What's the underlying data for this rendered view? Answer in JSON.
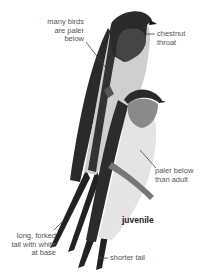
{
  "illustration": {
    "subject": "barn swallow adult and juvenile",
    "colors": {
      "dark_plumage": "#2a2a2a",
      "throat": "#4a4a4a",
      "underparts": "#d9d9d9",
      "leader_line": "#444444",
      "text": "#555555"
    }
  },
  "annotations": {
    "paler_below_line1": "many birds",
    "paler_below_line2": "are paler",
    "paler_below_line3": "below",
    "throat_line1": "chestnut",
    "throat_line2": "throat",
    "juvenile_paler_line1": "paler below",
    "juvenile_paler_line2": "than adult",
    "juvenile_label": "juvenile",
    "tail_line1": "long, forked",
    "tail_line2": "tail with white",
    "tail_line3": "at base",
    "short_tail": "shorter tail"
  }
}
